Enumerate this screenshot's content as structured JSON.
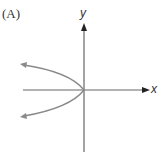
{
  "figure": {
    "panel_label": "(A)",
    "x_axis_label": "x",
    "y_axis_label": "y",
    "curve_description": "Parabola opening to the left with vertex at the origin, both ends with arrows",
    "colors": {
      "axis": "#555555",
      "curve": "#8a8a8a",
      "text": "#333333"
    }
  }
}
